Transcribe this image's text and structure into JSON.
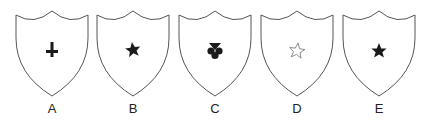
{
  "figure": {
    "shields": [
      {
        "label": "A",
        "symbol": "inverted-cross",
        "symbol_style": "filled",
        "left": 12
      },
      {
        "label": "B",
        "symbol": "star",
        "symbol_style": "filled",
        "left": 93
      },
      {
        "label": "C",
        "symbol": "club",
        "symbol_style": "filled",
        "left": 175
      },
      {
        "label": "D",
        "symbol": "star",
        "symbol_style": "outline",
        "left": 257
      },
      {
        "label": "E",
        "symbol": "star",
        "symbol_style": "filled",
        "left": 339
      }
    ],
    "colors": {
      "outline": "#555555",
      "symbol": "#1a1a1a",
      "background": "#ffffff"
    }
  }
}
